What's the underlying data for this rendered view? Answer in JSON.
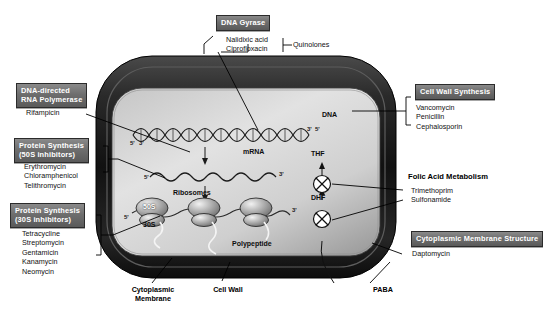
{
  "figure": {
    "type": "diagram"
  },
  "targets": [
    {
      "id": "dna-gyrase",
      "label": "DNA Gyrase",
      "style": "gray-box",
      "drugs": [
        "Nalidixic acid",
        "Ciprofloxacin"
      ],
      "group_label": "Quinolones"
    },
    {
      "id": "rna-polymerase",
      "label_line1": "DNA-directed",
      "label_line2": "RNA Polymerase",
      "style": "gray-box",
      "drugs": [
        "Rifampicin"
      ]
    },
    {
      "id": "protein-synthesis-50s",
      "label_line1": "Protein Synthesis",
      "label_line2": "(50S inhibitors)",
      "style": "gray-box",
      "drugs": [
        "Erythromycin",
        "Chloramphenicol",
        "Telithromycin"
      ]
    },
    {
      "id": "protein-synthesis-30s",
      "label_line1": "Protein Synthesis",
      "label_line2": "(30S inhibitors)",
      "style": "gray-box",
      "drugs": [
        "Tetracycline",
        "Streptomycin",
        "Gentamicin",
        "Kanamycin",
        "Neomycin"
      ]
    },
    {
      "id": "cell-wall-synthesis",
      "label": "Cell Wall Synthesis",
      "style": "gray-box",
      "drugs": [
        "Vancomycin",
        "Penicillin",
        "Cephalosporin"
      ]
    },
    {
      "id": "folic-acid-metabolism",
      "label": "Folic Acid Metabolism",
      "style": "plain-bold",
      "drugs": [
        "Trimethoprim",
        "Sulfonamide"
      ]
    },
    {
      "id": "cytoplasmic-membrane-structure",
      "label": "Cytoplasmic Membrane Structure",
      "style": "gray-box",
      "drugs": [
        "Daptomycin"
      ]
    }
  ],
  "cell_labels": {
    "dna": "DNA",
    "mrna": "mRNA",
    "ribosomes": "Ribosomes",
    "subunit_large": "50S",
    "subunit_small": "30S",
    "polypeptide": "Polypeptide",
    "thf": "THF",
    "dhf": "DHF",
    "paba": "PABA",
    "cell_wall": "Cell Wall",
    "membrane_line1": "Cytoplasmic",
    "membrane_line2": "Membrane"
  },
  "strand_ticks": {
    "dna_left_5": "5'",
    "dna_left_3": "3'",
    "dna_right_3": "3'",
    "dna_right_5": "5'",
    "mrna_left_5": "5'",
    "mrna_right_3": "3'",
    "ribosome_row_5": "5'",
    "ribosome_row_3": "3'"
  },
  "colors": {
    "box_fill": "#6e6e6e",
    "box_text": "#ffffff",
    "box_border": "#2b2b2b",
    "cell_wall_dark": "#232323",
    "cytoplasm_light": "#d9d9d9",
    "line": "#000000",
    "blocker_fill": "#ffffff"
  }
}
